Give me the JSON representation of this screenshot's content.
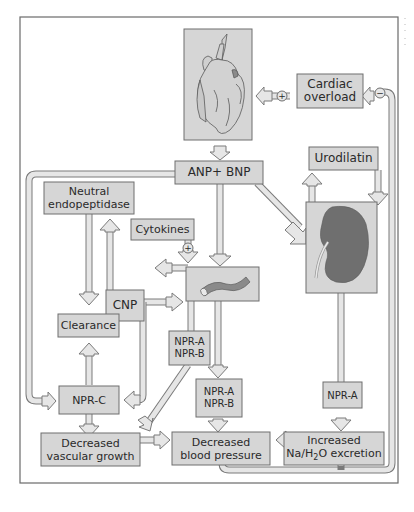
{
  "diagram": {
    "colors": {
      "box_fill": "#d6d6d6",
      "box_stroke": "#6e6e6e",
      "arrow_fill": "#e4e4e4",
      "arrow_stroke": "#7a7a7a",
      "frame": "#6a6a6a",
      "kidney": "#6f6f6f",
      "text": "#2a2a2a"
    },
    "nodes": {
      "heart": {
        "icon": "heart-illustration"
      },
      "cardiac_overload": {
        "line1": "Cardiac",
        "line2": "overload"
      },
      "anp_bnp": {
        "label": "ANP+ BNP"
      },
      "urodilatin": {
        "label": "Urodilatin"
      },
      "kidney": {
        "icon": "kidney-illustration"
      },
      "neutral_endopeptidase": {
        "line1": "Neutral",
        "line2": "endopeptidase"
      },
      "cytokines": {
        "label": "Cytokines"
      },
      "vessel": {
        "icon": "blood-vessel-illustration"
      },
      "cnp": {
        "label": "CNP"
      },
      "clearance": {
        "label": "Clearance"
      },
      "npr_ab_left": {
        "line1": "NPR-A",
        "line2": "NPR-B"
      },
      "npr_ab_center": {
        "line1": "NPR-A",
        "line2": "NPR-B"
      },
      "npr_c": {
        "label": "NPR-C"
      },
      "npr_a": {
        "label": "NPR-A"
      },
      "decreased_vascular_growth": {
        "line1": "Decreased",
        "line2": "vascular growth"
      },
      "decreased_blood_pressure": {
        "line1": "Decreased",
        "line2": "blood pressure"
      },
      "increased_excretion": {
        "line1": "Increased",
        "line2_pre": "Na/H",
        "line2_sub": "2",
        "line2_post": "O excretion"
      }
    },
    "modifiers": {
      "plus": "+",
      "minus": "−"
    },
    "edges": [
      {
        "from": "heart",
        "to": "anp_bnp"
      },
      {
        "from": "cardiac_overload",
        "to": "heart",
        "sign": "+"
      },
      {
        "from": "increased_excretion",
        "to": "cardiac_overload",
        "sign": "−"
      },
      {
        "from": "anp_bnp",
        "to": "npr_c"
      },
      {
        "from": "anp_bnp",
        "to": "vessel"
      },
      {
        "from": "anp_bnp",
        "to": "kidney"
      },
      {
        "from": "kidney",
        "to": "urodilatin"
      },
      {
        "from": "urodilatin",
        "to": "kidney"
      },
      {
        "from": "cytokines",
        "to": "vessel",
        "sign": "+"
      },
      {
        "from": "vessel",
        "to": "cnp"
      },
      {
        "from": "cnp",
        "to": "vessel"
      },
      {
        "from": "cnp",
        "to": "neutral_endopeptidase"
      },
      {
        "from": "cnp",
        "to": "npr_c"
      },
      {
        "from": "neutral_endopeptidase",
        "to": "clearance"
      },
      {
        "from": "npr_c",
        "to": "clearance"
      },
      {
        "from": "npr_c",
        "to": "decreased_vascular_growth"
      },
      {
        "from": "npr_ab_left",
        "to": "decreased_vascular_growth"
      },
      {
        "from": "vessel",
        "to": "npr_ab_center"
      },
      {
        "from": "npr_ab_center",
        "to": "decreased_blood_pressure"
      },
      {
        "from": "decreased_vascular_growth",
        "to": "decreased_blood_pressure"
      },
      {
        "from": "kidney",
        "to": "npr_a"
      },
      {
        "from": "npr_a",
        "to": "increased_excretion"
      },
      {
        "from": "increased_excretion",
        "to": "decreased_blood_pressure"
      }
    ]
  }
}
